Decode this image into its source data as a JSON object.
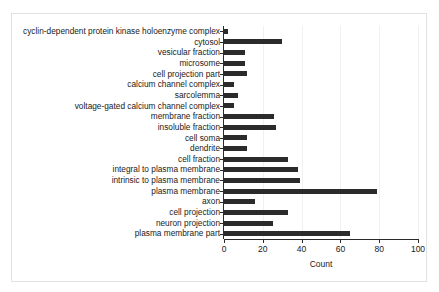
{
  "chart_data": {
    "type": "bar",
    "orientation": "horizontal",
    "title": "",
    "xlabel": "Count",
    "ylabel": "",
    "xlim": [
      0,
      100
    ],
    "xticks": [
      0,
      20,
      40,
      60,
      80,
      100
    ],
    "grid": true,
    "grid_axis": "x",
    "legend": false,
    "bar_color": "#2b2b2b",
    "categories": [
      "cyclin-dependent protein kinase holoenzyme complex",
      "cytosol",
      "vesicular fraction",
      "microsome",
      "cell projection part",
      "calcium channel complex",
      "sarcolemma",
      "voltage-gated calcium channel complex",
      "membrane fraction",
      "insoluble fraction",
      "cell soma",
      "dendrite",
      "cell fraction",
      "integral to plasma membrane",
      "intrinsic to plasma membrane",
      "plasma membrane",
      "axon",
      "cell projection",
      "neuron projection",
      "plasma membrane part"
    ],
    "values": [
      2,
      30,
      11,
      11,
      12,
      5,
      7,
      5,
      26,
      27,
      12,
      12,
      33,
      38,
      39,
      79,
      16,
      33,
      25,
      65
    ]
  }
}
